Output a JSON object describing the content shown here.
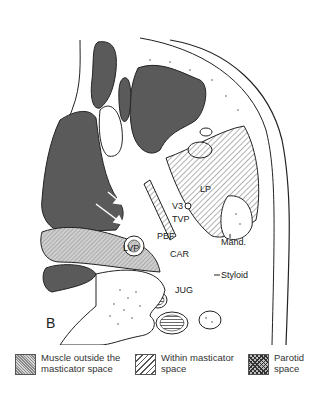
{
  "figure": {
    "panel_label": "B",
    "structure_labels": {
      "lp": "LP",
      "v3": "V3",
      "tvp": "TVP",
      "lvp": "LVP",
      "pbf": "PBF",
      "car": "CAR",
      "jug": "JUG",
      "mand": "Mand.",
      "styloid": "Styloid"
    }
  },
  "legend": {
    "items": [
      {
        "line1": "Muscle outside the",
        "line2": "masticator space",
        "pattern": "stipple"
      },
      {
        "line1": "Within masticator",
        "line2": "space",
        "pattern": "hatch"
      },
      {
        "line1": "Parotid",
        "line2": "space",
        "pattern": "crosshatch"
      }
    ]
  }
}
